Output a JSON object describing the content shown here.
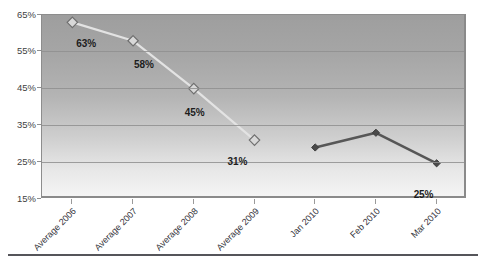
{
  "chart_data": {
    "type": "line",
    "title": "",
    "subtitle": "",
    "xlabel": "",
    "ylabel": "",
    "ylim": [
      15,
      65
    ],
    "ytick_step": 10,
    "ytick_labels": [
      "65%",
      "55%",
      "45%",
      "35%",
      "25%",
      "15%"
    ],
    "ytick_values": [
      65,
      55,
      45,
      35,
      25,
      15
    ],
    "grid": true,
    "grid_axis": "y",
    "legend": "none",
    "categories": [
      "Average 2006",
      "Average 2007",
      "Average 2008",
      "Average 2009",
      "Jan 2010",
      "Feb 2010",
      "Mar 2010"
    ],
    "series": [
      {
        "name": "Averages",
        "marker": "open-diamond",
        "line_color": "#e3e3e3",
        "marker_fill": "#d8d8d8",
        "marker_edge": "#6f6f6f",
        "values": [
          63,
          58,
          45,
          31,
          null,
          null,
          null
        ],
        "point_labels": [
          "63%",
          "58%",
          "45%",
          "31%",
          "",
          "",
          ""
        ]
      },
      {
        "name": "Monthly 2010",
        "marker": "filled-diamond",
        "line_color": "#575757",
        "marker_fill": "#4a4a4a",
        "marker_edge": "#3c3c3c",
        "values": [
          null,
          null,
          null,
          null,
          29,
          33,
          24.7
        ],
        "point_labels": [
          "",
          "",
          "",
          "",
          "",
          "",
          "25%"
        ]
      }
    ],
    "annotations": [
      {
        "text": "63%",
        "series": 0,
        "category_index": 0
      },
      {
        "text": "58%",
        "series": 0,
        "category_index": 1
      },
      {
        "text": "45%",
        "series": 0,
        "category_index": 2
      },
      {
        "text": "31%",
        "series": 0,
        "category_index": 3
      },
      {
        "text": "25%",
        "series": 1,
        "category_index": 6
      }
    ],
    "colors": {
      "plot_background_top": "#9e9e9e",
      "plot_background_bottom": "#f4f4f4",
      "gridline": "#8f8f8f",
      "plot_border": "#8a8a8a",
      "axis_text": "#3f3f3f",
      "data_label_text": "#1d1d1d",
      "bottom_rule": "#55555a"
    }
  }
}
